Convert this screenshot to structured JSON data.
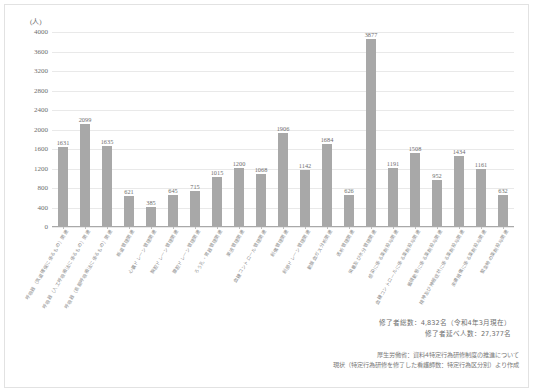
{
  "chart_data": {
    "type": "bar",
    "title": "",
    "xlabel": "",
    "ylabel": "(人)",
    "ylim": [
      0,
      4000
    ],
    "ytick_step": 400,
    "grid": true,
    "legend": "none",
    "bar_color": "#a8a8a8",
    "yticks": [
      "0",
      "400",
      "800",
      "1200",
      "1600",
      "2000",
      "2400",
      "2800",
      "3200",
      "3600",
      "4000"
    ],
    "categories": [
      "呼吸器（気道確保に係るもの）関連",
      "呼吸器（人工呼吸療法に係るもの）関連",
      "呼吸器（長期呼吸療法に係るもの）関連",
      "栃道管理関連",
      "心囊ドレーン管理関連",
      "胸腔ドレーン管理関連",
      "腹腔ドレーン管理関連",
      "ろう孔・胃器管理関連",
      "栗液管理関連",
      "血糖コントロール管理関連",
      "創傷管理関連",
      "創部ドレーン管理関連",
      "動脈血ガス分析関連",
      "透析管理関連",
      "栄養及び水分管理関連",
      "感染に係る薬剤投与関連",
      "血糖コントロールに係る薬剤投与関連",
      "循環動態に係る薬剤投与関連",
      "精神及び神経症状に係る薬剤投与関連",
      "皮膚損傷に係る薬剤投与関連",
      "緊急時の薬剤投与関連"
    ],
    "values": [
      1631,
      2099,
      1635,
      621,
      385,
      645,
      715,
      1015,
      1200,
      1068,
      1906,
      1142,
      1684,
      626,
      3877,
      1191,
      1508,
      952,
      1434,
      1161,
      632
    ],
    "value_labels": [
      "1631",
      "2099",
      "1635",
      "621",
      "385",
      "645",
      "715",
      "1015",
      "1200",
      "1068",
      "1906",
      "1142",
      "1684",
      "626",
      "3877",
      "1191",
      "1508",
      "952",
      "1434",
      "1161",
      "632"
    ]
  },
  "summary": {
    "line1": "修了者総数：4,832名（令和4年3月現在）",
    "line2": "修了者延べ人数：27,377名"
  },
  "source": {
    "line1": "厚生労働省：資料4特定行為研修制度の推進について",
    "line2": "現状（特定行為研修を修了した看護師数：特定行為区分別）より作成"
  }
}
